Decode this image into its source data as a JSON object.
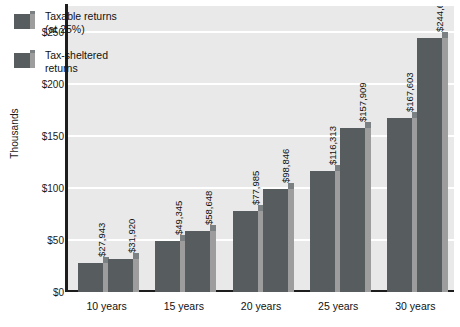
{
  "chart_data": {
    "type": "bar",
    "title": "",
    "subtitle": "",
    "xlabel": "",
    "ylabel": "Thousands",
    "categories": [
      "10 years",
      "15 years",
      "20 years",
      "25 years",
      "30 years"
    ],
    "series": [
      {
        "name": "Taxable returns (at 25%)",
        "values": [
          27943,
          49345,
          77985,
          116313,
          167603
        ],
        "labels": [
          "$27,943",
          "$49,345",
          "$77,985",
          "$116,313",
          "$167,603"
        ]
      },
      {
        "name": "Tax-sheltered returns",
        "values": [
          31920,
          58648,
          98846,
          157909,
          244691
        ],
        "labels": [
          "$31,920",
          "$58,648",
          "$98,846",
          "$157,909",
          "$244,691"
        ]
      }
    ],
    "ylim": [
      0,
      275000
    ],
    "yticks": [
      0,
      50000,
      100000,
      150000,
      200000,
      250000
    ],
    "ytick_labels": [
      "$0",
      "$50",
      "$100",
      "$150",
      "$200",
      "$250"
    ],
    "grid": "horizontal",
    "legend_position": "top-left",
    "colors": {
      "bar_front": "#575c5e",
      "bar_side": "#9d9d9d",
      "bar_top": "#7b8082",
      "plot_background": "#e9e9e9",
      "gridline": "#ffffff",
      "axis": "#1d1d1d",
      "text": "#111111"
    }
  },
  "legend": {
    "items": [
      {
        "label": "Taxable returns\n(at 25%)",
        "swatch": "bar-swatch"
      },
      {
        "label": "Tax-sheltered\nreturns",
        "swatch": "bar-swatch"
      }
    ]
  },
  "axis": {
    "y_title": "Thousands",
    "y_ticks": [
      "$0",
      "$50",
      "$100",
      "$150",
      "$200",
      "$250"
    ],
    "x_ticks": [
      "10 years",
      "15 years",
      "20 years",
      "25 years",
      "30 years"
    ]
  }
}
